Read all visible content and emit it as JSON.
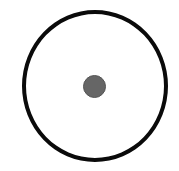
{
  "diagram": {
    "shapes": [
      {
        "type": "circle-outline",
        "role": "outer-ring",
        "stroke_color": "#0a0a0a",
        "fill": "none"
      },
      {
        "type": "circle-filled",
        "role": "center-dot",
        "fill_color": "#666666"
      }
    ]
  }
}
